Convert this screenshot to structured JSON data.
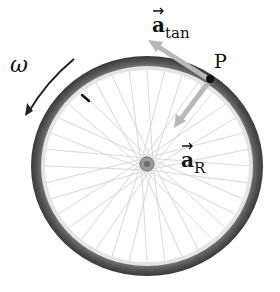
{
  "labels": {
    "omega": "ω",
    "point": "P",
    "a_tan_main": "a",
    "a_tan_sub": "tan",
    "a_r_main": "a",
    "a_r_sub": "R"
  },
  "colors": {
    "tire": "#5a5a5a",
    "rim": "#d8d8d8",
    "spoke": "#c8c8c8",
    "arrow_gray": "#b4b4b4",
    "text": "#111111"
  }
}
